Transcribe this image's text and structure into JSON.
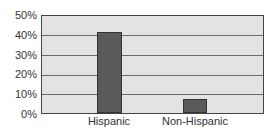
{
  "chart_data": {
    "type": "bar",
    "title": "",
    "xlabel": "",
    "ylabel": "",
    "categories": [
      "Hispanic",
      "Non-Hispanic"
    ],
    "values": [
      42,
      7
    ],
    "ylim": [
      0,
      50
    ],
    "yticks": [
      "0%",
      "10%",
      "20%",
      "30%",
      "40%",
      "50%"
    ],
    "grid": true,
    "legend": null,
    "colors": {
      "bar": "#5a5a5a",
      "plot_bg": "#e3e3e3",
      "grid": "#6a6a6a"
    }
  }
}
